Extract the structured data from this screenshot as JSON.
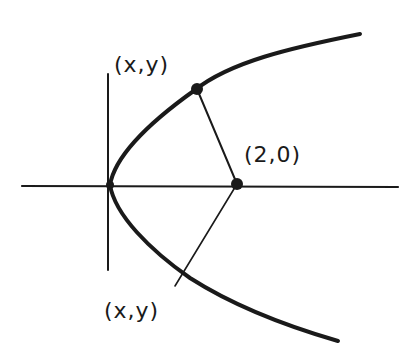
{
  "diagram": {
    "type": "parabola-distance-sketch",
    "style": "hand-drawn",
    "colors": {
      "ink": "#1a1a1a",
      "background": "#ffffff"
    },
    "axes": {
      "horizontal": "x-axis",
      "vertical": "y-axis"
    },
    "curve": "parabola opening right with vertex at origin",
    "labels": {
      "point_upper": "(x,y)",
      "focus_point": "(2,0)",
      "point_lower": "(x,y)"
    },
    "segments": [
      "upper point (x,y) to (2,0)",
      "(2,0) to lower point (x,y)"
    ]
  }
}
